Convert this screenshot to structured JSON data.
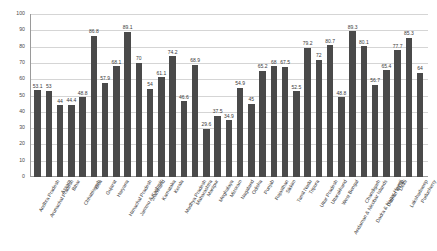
{
  "chart_data": {
    "type": "bar",
    "title": "",
    "subtitle": "",
    "xlabel": "",
    "ylabel": "",
    "ylim": [
      0,
      100
    ],
    "y_ticks": [
      0,
      10,
      20,
      30,
      40,
      50,
      60,
      70,
      80,
      90,
      100
    ],
    "grid": true,
    "legend": false,
    "legend_position": "none",
    "bar_color": "#4a4a4a",
    "gridline_color": "#d5d5d5",
    "axis_color": "#9a9a9a",
    "categories": [
      "Andhra Pradesh",
      "Arunachal Pradesh",
      "Assam",
      "Bihar",
      "Chhattisgarh",
      "Goa",
      "Gujarat",
      "Haryana",
      "Himachal Pradesh",
      "Jammu & Kashmir",
      "Jharkhand",
      "Karnataka",
      "Kerala",
      "Madhya Pradesh",
      "Maharashtra",
      "Manipur",
      "Meghalaya",
      "Mizoram",
      "Nagaland",
      "Odisha",
      "Punjab",
      "Rajasthan",
      "Sikkim",
      "Tamil Nadu",
      "Tripura",
      "Uttar Pradesh",
      "Uttarakhand",
      "West Bengal",
      "Andaman & Nicobar Islands",
      "Chandigarh",
      "Dadra & Nagar Haveli",
      "Daman & Diu",
      "Delhi",
      "Lakshadweep",
      "Puducherry"
    ],
    "values": [
      53.1,
      53,
      44,
      44.4,
      48.8,
      86.8,
      57.9,
      68.1,
      89.1,
      70,
      54,
      61.1,
      74.2,
      46.6,
      68.9,
      29.6,
      37.5,
      34.9,
      54.9,
      45,
      65.2,
      68,
      67.5,
      52.5,
      79.2,
      72,
      80.7,
      48.8,
      89.3,
      80.1,
      56.7,
      65.4,
      77.7,
      85.3,
      64
    ],
    "value_labels": [
      "53.1",
      "53",
      "44",
      "44.4",
      "48.8",
      "86.8",
      "57.9",
      "68.1",
      "89.1",
      "70",
      "54",
      "61.1",
      "74.2",
      "46.6",
      "68.9",
      "29.6",
      "37.5",
      "34.9",
      "54.9",
      "45",
      "65.2",
      "68",
      "67.5",
      "52.5",
      "79.2",
      "72",
      "80.7",
      "48.8",
      "89.3",
      "80.1",
      "56.7",
      "65.4",
      "77.7",
      "85.3",
      "64"
    ]
  }
}
